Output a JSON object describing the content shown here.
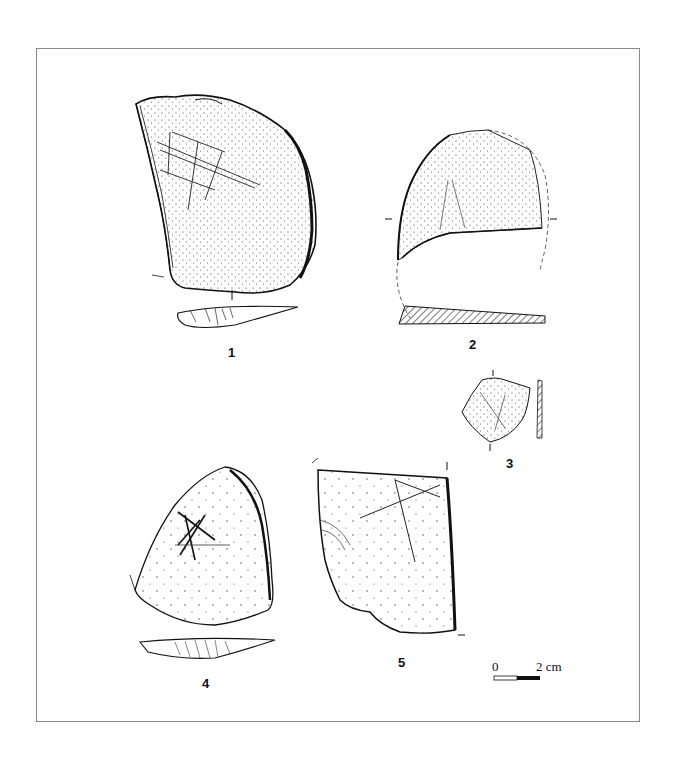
{
  "figure": {
    "type": "archaeological lithic drawing plate",
    "artifacts": [
      {
        "id": "1",
        "label": "1",
        "description": "flake with incised cross-hatched lines, with cross-section below"
      },
      {
        "id": "2",
        "label": "2",
        "description": "fragment with dashed reconstructed outline and hatched cross-section"
      },
      {
        "id": "3",
        "label": "3",
        "description": "small fragment with incised lines and profile"
      },
      {
        "id": "4",
        "label": "4",
        "description": "triangular flake with crossed incisions, with profile below"
      },
      {
        "id": "5",
        "label": "5",
        "description": "flake with long incised lines"
      }
    ],
    "scale_bar": {
      "start_label": "0",
      "end_label": "2 cm"
    }
  }
}
